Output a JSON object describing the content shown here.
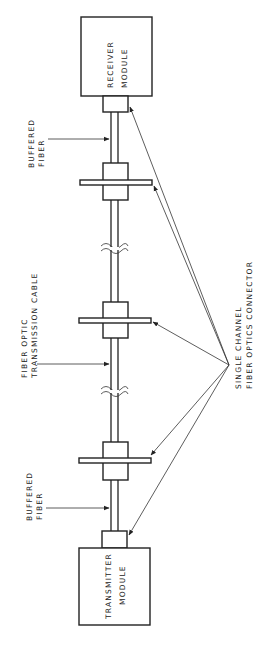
{
  "diagram": {
    "type": "fiber-optic link block diagram (rotated 90°)",
    "receiver": {
      "line1": "RECEIVER",
      "line2": "MODULE"
    },
    "transmitter": {
      "line1": "TRANSMITTER",
      "line2": "MODULE"
    },
    "labels": {
      "buffered_fiber_top": {
        "line1": "BUFFERED",
        "line2": "FIBER"
      },
      "buffered_fiber_bottom": {
        "line1": "BUFFERED",
        "line2": "FIBER"
      },
      "cable": {
        "line1": "FIBER OPTIC",
        "line2": "TRANSMISSION CABLE"
      },
      "connector": {
        "line1": "SINGLE CHANNEL",
        "line2": "FIBER OPTICS CONNECTOR"
      }
    },
    "connectors_count": 5,
    "cable_breaks_count": 2
  }
}
